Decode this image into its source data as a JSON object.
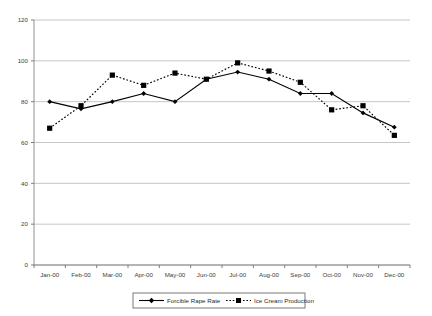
{
  "chart_data": {
    "type": "line",
    "title": "",
    "subtitle": "",
    "xlabel": "",
    "ylabel": "",
    "categories": [
      "Jan-00",
      "Feb-00",
      "Mar-00",
      "Apr-00",
      "May-00",
      "Jun-00",
      "Jul-00",
      "Aug-00",
      "Sep-00",
      "Oct-00",
      "Nov-00",
      "Dec-00"
    ],
    "series": [
      {
        "name": "Forcible Rape Rate",
        "style": "solid",
        "marker": "diamond",
        "color": "#000000",
        "values": [
          80,
          76.5,
          80,
          84,
          80,
          91,
          94.5,
          91,
          84,
          84,
          74.5,
          67.5
        ]
      },
      {
        "name": "Ice Cream Production",
        "style": "dotted",
        "marker": "square",
        "color": "#000000",
        "values": [
          67,
          78,
          93,
          88,
          94,
          91,
          99,
          95,
          89.5,
          76,
          78,
          63.5
        ]
      }
    ],
    "ylim": [
      0,
      120
    ],
    "yticks": [
      0,
      20,
      40,
      60,
      80,
      100,
      120
    ],
    "ytick_labels": [
      "0",
      "20",
      "40",
      "60",
      "80",
      "100",
      "120"
    ],
    "xtick_labels": [
      "Jan-00",
      "Feb-00",
      "Mar-00",
      "Apr-00",
      "May-00",
      "Jun-00",
      "Jul-00",
      "Aug-00",
      "Sep-00",
      "Oct-00",
      "Nov-00",
      "Dec-00"
    ],
    "grid": {
      "horizontal": true,
      "vertical": false,
      "color": "#c0c0c0"
    },
    "legend": {
      "position": "bottom-center",
      "entries": [
        {
          "label": "Forcible Rape Rate",
          "style": "solid",
          "marker": "diamond"
        },
        {
          "label": "Ice Cream Production",
          "style": "dotted",
          "marker": "square"
        }
      ]
    },
    "axis_color": "#808080",
    "plot_background": "#ffffff"
  },
  "legend": {
    "entry_0_label": "Forcible Rape Rate",
    "entry_1_label": "Ice Cream Production"
  }
}
